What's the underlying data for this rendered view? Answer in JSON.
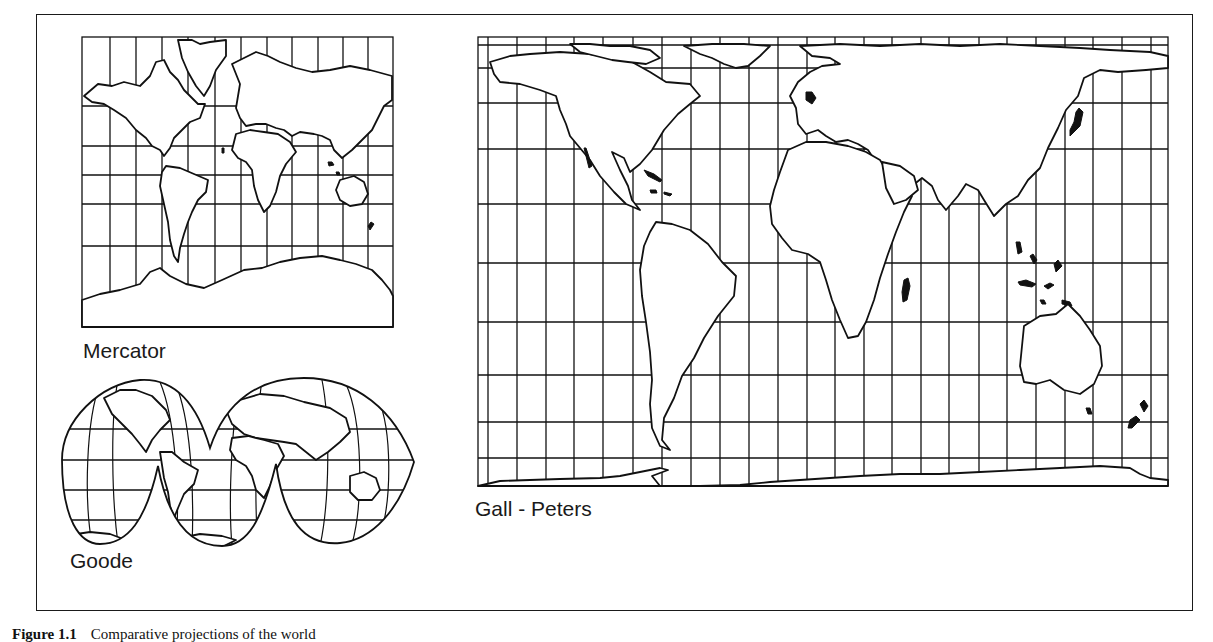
{
  "figure": {
    "caption_label": "Figure 1.1",
    "caption_text": "Comparative projections of the world"
  },
  "maps": [
    {
      "id": "mercator",
      "label": "Mercator",
      "box": {
        "x": 82,
        "y": 37,
        "width": 311,
        "height": 290
      },
      "meridians_x": [
        110,
        136,
        162,
        188,
        215,
        241,
        267,
        292,
        318,
        343,
        368
      ],
      "parallels_y": [
        106,
        146,
        175,
        204,
        246
      ]
    },
    {
      "id": "goode",
      "label": "Goode",
      "box": {
        "x": 60,
        "y": 380,
        "width": 355,
        "height": 162
      },
      "parallels_y": [
        429,
        460,
        490,
        520
      ]
    },
    {
      "id": "gall-peters",
      "label": "Gall - Peters",
      "box": {
        "x": 478,
        "y": 37,
        "width": 690,
        "height": 449
      },
      "meridians_x": [
        488,
        517,
        546,
        574,
        603,
        633,
        662,
        691,
        720,
        749,
        778,
        807,
        835,
        864,
        892,
        921,
        949,
        979,
        1007,
        1036,
        1065,
        1093,
        1122,
        1151
      ],
      "parallels_y": [
        45,
        68,
        103,
        149,
        204,
        263,
        322,
        375,
        422,
        458
      ]
    }
  ]
}
